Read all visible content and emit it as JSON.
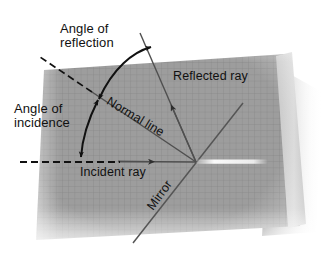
{
  "figure": {
    "medium": "photograph of graph paper sheet",
    "background_color": "#ffffff",
    "paper_color": "#9e9e9e",
    "grid_color": "#8a8a8a",
    "ink_color": "#111111",
    "ray_color": "#4a4a4a",
    "highlight_color": "#f2f2f2"
  },
  "labels": {
    "angle_of_reflection": "Angle of\nreflection",
    "angle_of_incidence": "Angle of\nincidence",
    "reflected_ray": "Reflected ray",
    "incident_ray": "Incident ray",
    "normal_line": "Normal line",
    "mirror": "Mirror"
  },
  "geometry": {
    "vertex": [
      196,
      162
    ],
    "normal_junction": [
      97,
      97
    ],
    "incident_dash_start": [
      20,
      162
    ],
    "incident_dash_end": [
      120,
      162
    ],
    "reflected_tip": [
      152,
      50
    ],
    "mirror_line": [
      [
        133,
        243
      ],
      [
        243,
        103
      ]
    ],
    "normal_line": [
      [
        78,
        82
      ],
      [
        196,
        162
      ]
    ],
    "incident_ray_arrow_at": [
      148,
      160
    ]
  },
  "elements": {
    "incident_ray": "incident-ray-line",
    "reflected_ray": "reflected-ray-line",
    "normal_line": "normal-line",
    "mirror_surface": "mirror-line",
    "reflection_arc": "angle-of-reflection-arc",
    "incidence_arc": "angle-of-incidence-arc",
    "light_spot": "mirror-highlight-streak"
  }
}
